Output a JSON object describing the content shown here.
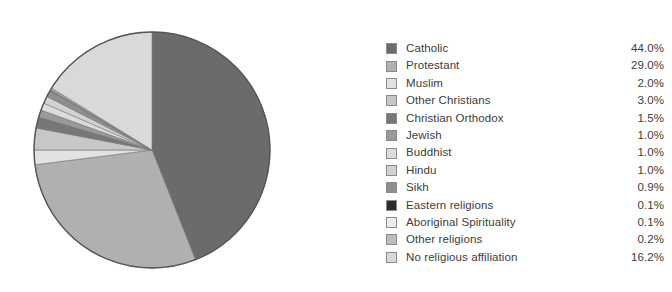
{
  "chart_data": {
    "type": "pie",
    "title": "",
    "subtitle": "",
    "xlabel": "",
    "ylabel": "",
    "legend_position": "right",
    "grid": false,
    "unit": "%",
    "start_angle_deg": 0,
    "direction": "clockwise",
    "categories": [
      "Catholic",
      "Protestant",
      "Muslim",
      "Other Christians",
      "Christian Orthodox",
      "Jewish",
      "Buddhist",
      "Hindu",
      "Sikh",
      "Eastern religions",
      "Aboriginal Spirituality",
      "Other religions",
      "No religious affiliation"
    ],
    "values": [
      44.0,
      29.0,
      2.0,
      3.0,
      1.5,
      1.0,
      1.0,
      1.0,
      0.9,
      0.1,
      0.1,
      0.2,
      16.2
    ],
    "value_labels": [
      "44.0%",
      "29.0%",
      "2.0%",
      "3.0%",
      "1.5%",
      "1.0%",
      "1.0%",
      "1.0%",
      "0.9%",
      "0.1%",
      "0.1%",
      "0.2%",
      "16.2%"
    ],
    "colors": [
      "#6b6b6b",
      "#b0b0b0",
      "#e2e2e2",
      "#c7c7c7",
      "#777777",
      "#9a9a9a",
      "#dcdcdc",
      "#d2d2d2",
      "#8e8e8e",
      "#2b2b2b",
      "#ececec",
      "#bdbdbd",
      "#d9d9d9"
    ]
  },
  "legend": {
    "items": [
      {
        "label": "Catholic",
        "value": "44.0%",
        "color": "#6b6b6b"
      },
      {
        "label": "Protestant",
        "value": "29.0%",
        "color": "#b0b0b0"
      },
      {
        "label": "Muslim",
        "value": "2.0%",
        "color": "#e2e2e2"
      },
      {
        "label": "Other Christians",
        "value": "3.0%",
        "color": "#c7c7c7"
      },
      {
        "label": "Christian Orthodox",
        "value": "1.5%",
        "color": "#777777"
      },
      {
        "label": "Jewish",
        "value": "1.0%",
        "color": "#9a9a9a"
      },
      {
        "label": "Buddhist",
        "value": "1.0%",
        "color": "#dcdcdc"
      },
      {
        "label": "Hindu",
        "value": "1.0%",
        "color": "#d2d2d2"
      },
      {
        "label": "Sikh",
        "value": "0.9%",
        "color": "#8e8e8e"
      },
      {
        "label": "Eastern religions",
        "value": "0.1%",
        "color": "#2b2b2b"
      },
      {
        "label": "Aboriginal Spirituality",
        "value": "0.1%",
        "color": "#ececec"
      },
      {
        "label": "Other religions",
        "value": "0.2%",
        "color": "#bdbdbd"
      },
      {
        "label": "No religious affiliation",
        "value": "16.2%",
        "color": "#d9d9d9"
      }
    ]
  },
  "pie": {
    "center_x": 152,
    "center_y": 150,
    "radius": 118,
    "outline_color": "#555555"
  }
}
